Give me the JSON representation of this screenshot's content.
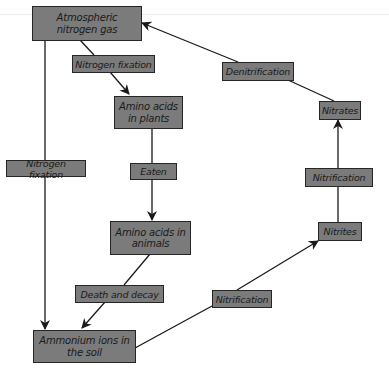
{
  "diagram": {
    "colors": {
      "box_fill": "#7b7b7b",
      "box_border": "#262626",
      "text": "#1a1a1a",
      "line": "#1a1a1a"
    },
    "nodes": {
      "atmospheric_nitrogen": "Atmospheric nitrogen gas",
      "amino_acids_plants": "Amino acids in plants",
      "amino_acids_animals": "Amino acids in animals",
      "ammonium_ions": "Ammonium ions in the soil",
      "nitrites": "Nitrites",
      "nitrates": "Nitrates"
    },
    "processes": {
      "nitrogen_fixation_top": "Nitrogen fixation",
      "nitrogen_fixation_left": "Nitrogen fixation",
      "eaten": "Eaten",
      "death_and_decay": "Death and decay",
      "nitrification_bottom": "Nitrification",
      "nitrification_right": "Nitrification",
      "denitrification": "Denitrification"
    },
    "edges": [
      {
        "from": "Atmospheric nitrogen gas",
        "to": "Amino acids in plants",
        "label": "Nitrogen fixation"
      },
      {
        "from": "Atmospheric nitrogen gas",
        "to": "Ammonium ions in the soil",
        "label": "Nitrogen fixation"
      },
      {
        "from": "Amino acids in plants",
        "to": "Amino acids in animals",
        "label": "Eaten"
      },
      {
        "from": "Amino acids in animals",
        "to": "Ammonium ions in the soil",
        "label": "Death and decay"
      },
      {
        "from": "Ammonium ions in the soil",
        "to": "Nitrites",
        "label": "Nitrification"
      },
      {
        "from": "Nitrites",
        "to": "Nitrates",
        "label": "Nitrification"
      },
      {
        "from": "Nitrates",
        "to": "Atmospheric nitrogen gas",
        "label": "Denitrification"
      }
    ]
  }
}
